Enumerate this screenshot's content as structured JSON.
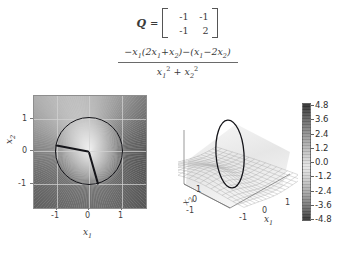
{
  "figure": {
    "background_color": "#ffffff",
    "equation": {
      "q_symbol": "Q",
      "equals": "=",
      "matrix": {
        "rows": [
          [
            "-1",
            "-1"
          ],
          [
            "-1",
            "2"
          ]
        ]
      },
      "fraction": {
        "numerator_parts": {
          "lead_minus": "−",
          "x1": "x",
          "x1_sub": "1",
          "open": "(2",
          "x1b": "x",
          "x1b_sub": "1",
          "plus": "+",
          "x2": "x",
          "x2_sub": "2",
          "close": ")",
          "minus2": "−(",
          "x1c": "x",
          "x1c_sub": "1",
          "minus3": "−2",
          "x2b": "x",
          "x2b_sub": "2",
          "close2": ")"
        },
        "numerator_text": "−x₁(2x₁+x₂)−(x₁−2x₂)",
        "denominator_text": "x₁² + x₂²",
        "denominator_parts": {
          "x1": "x",
          "x1_sub": "1",
          "x1_sup": "2",
          "plus": "+",
          "x2": "x",
          "x2_sub": "2",
          "x2_sup": "2"
        }
      }
    },
    "plot_2d": {
      "title": "",
      "xlabel_base": "x",
      "xlabel_sub": "1",
      "ylabel_base": "x",
      "ylabel_sub": "2",
      "xticks": [
        "-1",
        "0",
        "1"
      ],
      "yticks": [
        "1",
        "0",
        "-1"
      ],
      "xlim": [
        -1.7,
        1.7
      ],
      "ylim": [
        -1.7,
        1.7
      ],
      "unit_circle_radius": 1,
      "eigen_lines_deg": [
        191,
        -74
      ],
      "circle_color": "#15151a"
    },
    "plot_3d": {
      "xlabel_base": "x",
      "xlabel_sub": "1",
      "ylabel_base": "x",
      "ylabel_sub": "2",
      "xticks": [
        "-1",
        "0",
        "1"
      ],
      "yticks": [
        "1",
        "0",
        "-1"
      ],
      "surface_style": "wireframe-mesh-saddle",
      "trace_color": "#15151a"
    },
    "colorbar": {
      "ticks": [
        "4.8",
        "3.6",
        "2.4",
        "1.2",
        "0.0",
        "-1.2",
        "-2.4",
        "-3.6",
        "-4.8"
      ],
      "vmin": -4.8,
      "vmax": 4.8,
      "colormap": "grayscale"
    }
  },
  "chart_data": {
    "type": "heatmap",
    "xlabel": "x1",
    "ylabel": "x2",
    "xlim": [
      -1.7,
      1.7
    ],
    "ylim": [
      -1.7,
      1.7
    ],
    "zlim": [
      -4.8,
      4.8
    ],
    "colorbar_ticks": [
      4.8,
      3.6,
      2.4,
      1.2,
      0.0,
      -1.2,
      -2.4,
      -3.6,
      -4.8
    ],
    "matrix_Q": [
      [
        -1,
        -1
      ],
      [
        -1,
        2
      ]
    ],
    "function": "(-x1*(2*x1+x2)-(x1-2*x2))/(x1^2+x2^2)",
    "overlays": [
      {
        "name": "unit-circle",
        "radius": 1,
        "color": "#15151a"
      },
      {
        "name": "eigenvector-line-1",
        "angle_deg": 191,
        "length": 1
      },
      {
        "name": "eigenvector-line-2",
        "angle_deg": -74,
        "length": 1
      }
    ],
    "grid": true,
    "legend": "none",
    "panels": [
      {
        "kind": "heatmap",
        "position": "left"
      },
      {
        "kind": "surface",
        "position": "right"
      }
    ]
  }
}
